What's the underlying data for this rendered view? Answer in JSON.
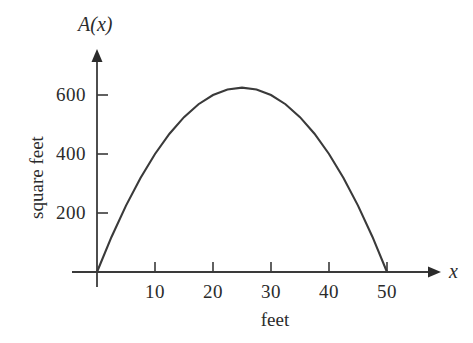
{
  "chart_data": {
    "type": "line",
    "title": "",
    "subtitle": "",
    "xlabel": "feet",
    "ylabel": "square feet",
    "x_axis_symbol": "x",
    "y_axis_symbol": "A(x)",
    "xlim": [
      0,
      57
    ],
    "ylim": [
      0,
      700
    ],
    "grid": false,
    "legend": null,
    "xticks": [
      10,
      20,
      30,
      40,
      50
    ],
    "xtick_labels": [
      "10",
      "20",
      "30",
      "40",
      "50"
    ],
    "yticks": [
      200,
      400,
      600
    ],
    "ytick_labels": [
      "200",
      "400",
      "600"
    ],
    "curve_color": "#3a3a3a",
    "axis_color": "#3a3a3a",
    "series": [
      {
        "name": "A(x)",
        "x": [
          0,
          2.5,
          5,
          7.5,
          10,
          12.5,
          15,
          17.5,
          20,
          22.5,
          25,
          27.5,
          30,
          32.5,
          35,
          37.5,
          40,
          42.5,
          45,
          47.5,
          50
        ],
        "values": [
          0,
          118.75,
          225,
          318.75,
          400,
          468.75,
          525,
          568.75,
          600,
          618.75,
          625,
          618.75,
          600,
          568.75,
          525,
          468.75,
          400,
          318.75,
          225,
          118.75,
          0
        ]
      }
    ],
    "annotations": {
      "peak_x": 25,
      "peak_value": 625,
      "root_left": 0,
      "root_right": 50
    }
  },
  "axis_labels": {
    "y_symbol": "A(x)",
    "x_symbol": "x",
    "y_title": "square feet",
    "x_title": "feet"
  }
}
